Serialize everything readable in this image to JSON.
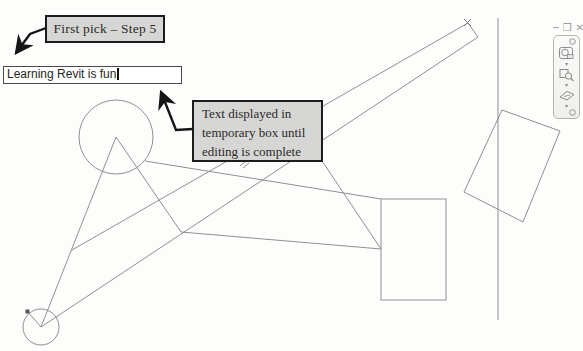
{
  "canvas": {
    "width": 583,
    "height": 351,
    "background": "#fdfdfc",
    "line_color": "#8f8f8f"
  },
  "callouts": {
    "first_pick": {
      "label": "First pick – Step 5",
      "fill": "#d6d6d4",
      "border": "#1c1c1c"
    },
    "temp_text": {
      "label": "Text displayed in temporary box until editing is complete",
      "lines": [
        "Text displayed in",
        "temporary box until",
        "editing is complete"
      ],
      "fill": "#d6d6d4",
      "border": "#1c1c1c"
    }
  },
  "text_input": {
    "value": "Learning Revit is fun",
    "state": "editing"
  },
  "window_controls": {
    "minimize": {
      "glyph": "─"
    },
    "restore": {
      "glyph": "❐"
    },
    "close": {
      "glyph": "✕"
    }
  },
  "navigation_bar": {
    "icons": [
      {
        "name": "steering-wheel"
      },
      {
        "name": "zoom-region"
      },
      {
        "name": "pan-view"
      }
    ]
  },
  "sketch": {
    "stroke": "#8f8f8f",
    "circles": [
      {
        "name": "large-circle",
        "cx": 116,
        "cy": 137,
        "r": 37
      },
      {
        "name": "small-circle",
        "cx": 41,
        "cy": 327,
        "r": 18
      }
    ],
    "lines": [
      {
        "name": "apex-left-line",
        "p": [
          116,
          137,
          41,
          327
        ]
      },
      {
        "name": "apex-right-line",
        "p": [
          116,
          137,
          181,
          232
        ]
      },
      {
        "name": "vertex-to-rect-line",
        "p": [
          181,
          232,
          381,
          249
        ]
      },
      {
        "name": "behind-box-to-rect-line",
        "p": [
          300,
          128,
          381,
          249
        ]
      },
      {
        "name": "circle-to-rect-line",
        "p": [
          145,
          161,
          381,
          199
        ]
      },
      {
        "name": "bar-upper-line",
        "p": [
          72,
          250,
          468,
          23
        ]
      },
      {
        "name": "bar-lower-line",
        "p": [
          41,
          327,
          478,
          37
        ]
      },
      {
        "name": "bar-cap-line",
        "p": [
          468,
          23,
          478,
          37
        ]
      },
      {
        "name": "grip-line",
        "p": [
          41,
          327,
          28,
          312
        ]
      },
      {
        "name": "vertical-reference-line",
        "p": [
          498,
          18,
          498,
          320
        ]
      },
      {
        "name": "tip-cross-a",
        "p": [
          464,
          19,
          471,
          26
        ],
        "stroke": "#777777",
        "w": 1
      },
      {
        "name": "tip-cross-b",
        "p": [
          471,
          19,
          464,
          26
        ],
        "stroke": "#777777",
        "w": 1
      },
      {
        "name": "squiggle-a",
        "p": [
          240,
          166,
          246,
          161
        ],
        "stroke": "#6a6a6a",
        "w": 0.8
      },
      {
        "name": "squiggle-b",
        "p": [
          243,
          168,
          249,
          163
        ],
        "stroke": "#6a6a6a",
        "w": 0.8
      }
    ],
    "rects": [
      {
        "name": "axis-rectangle",
        "x": 381,
        "y": 199,
        "w": 65,
        "h": 101
      }
    ],
    "polygons": [
      {
        "name": "tilted-rectangle",
        "points": "502,110 560,131 523,222 464,192"
      }
    ],
    "grip": {
      "x": 25.5,
      "y": 309.5,
      "size": 4,
      "color": "#555555"
    }
  },
  "leaders": {
    "color": "#151515",
    "first_pick_leader": {
      "points": "46,28 30,34 16,53"
    },
    "temp_text_leader": {
      "points": "193,129 176,130 161,92"
    }
  }
}
